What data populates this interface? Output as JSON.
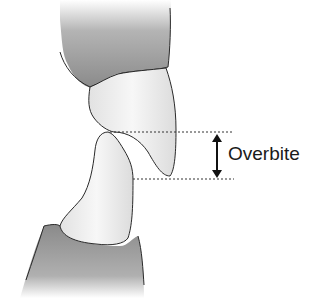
{
  "diagram": {
    "label": "Overbite",
    "elements": [
      "upper-gum",
      "upper-incisor",
      "lower-incisor",
      "lower-gum",
      "overbite-measure"
    ],
    "colors": {
      "gum": "#8f8f8f",
      "tooth": "#ededed",
      "outline": "#2a2a2a",
      "text": "#1a1a1a"
    }
  }
}
